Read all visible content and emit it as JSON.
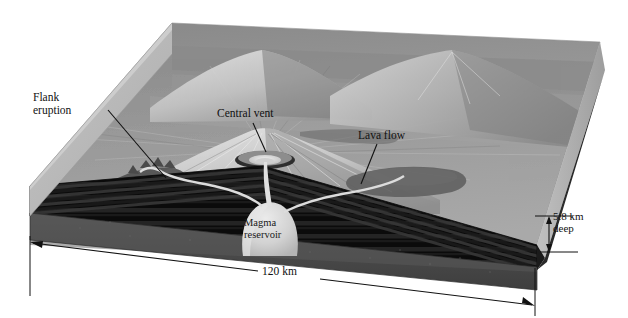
{
  "figure": {
    "labels": {
      "flank_eruption_l1": "Flank",
      "flank_eruption_l2": "eruption",
      "central_vent": "Central vent",
      "lava_flow": "Lava flow",
      "magma_reservoir_l1": "Magma",
      "magma_reservoir_l2": "reservoir",
      "scale_width": "120 km",
      "depth_l1": "5.8 km",
      "depth_l2": "deep"
    },
    "measurements": {
      "width_value": 120,
      "width_unit": "km",
      "depth_value": 5.8,
      "depth_unit": "km"
    },
    "colors": {
      "background": "#ffffff",
      "top_rim": "#c9c9c9",
      "side_face": "#b9b9b9",
      "terrain_light": "#b2b2b2",
      "terrain_mid": "#8f8f8f",
      "terrain_dark": "#6e6e6e",
      "crust_black": "#111111",
      "mantle_gray": "#4a4a4a",
      "magma": "#d8d8d8",
      "ink": "#111111"
    }
  }
}
